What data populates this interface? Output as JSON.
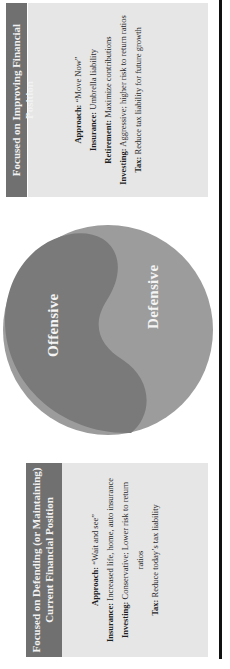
{
  "diagram": {
    "type": "yin-yang comparison",
    "orientation": "rotated 90deg (text reads bottom-to-top)",
    "colors": {
      "header_fill": "#707070",
      "box_fill": "#e6e6e6",
      "offensive_fill": "#7a7a7a",
      "defensive_fill": "#9c9c9c",
      "rule_line": "#111111"
    }
  },
  "left_box": {
    "title_line1": "Focused on Defending (or Maintaining)",
    "title_line2": "Current Financial Position",
    "items": [
      {
        "label": "Approach:",
        "text": " “Wait and see”"
      },
      {
        "label": "Insurance:",
        "text": " Increased life, home, auto insurance"
      },
      {
        "label": "Investing:",
        "text": " Conservative; Lower risk to return ratios"
      },
      {
        "label": "Tax:",
        "text": " Reduce today’s tax liability"
      }
    ]
  },
  "circle": {
    "top_label": "Offensive",
    "bottom_label": "Defensive"
  },
  "right_box": {
    "title": "Focused on Improving Financial Position",
    "items": [
      {
        "label": "Approach:",
        "text": " “Move Now”"
      },
      {
        "label": "Insurance:",
        "text": " Umbrella liability"
      },
      {
        "label": "Retirement:",
        "text": " Maximize contributions"
      },
      {
        "label": "Investing:",
        "text": " Aggressive; higher risk to return ratios"
      },
      {
        "label": "Tax:",
        "text": " Reduce tax liability for future growth"
      }
    ]
  }
}
